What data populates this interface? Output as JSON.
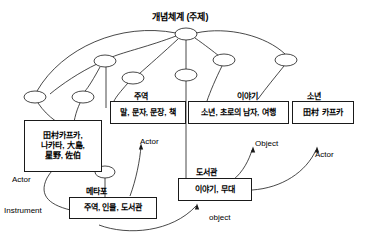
{
  "diagram": {
    "title": "개념체계 (주제)",
    "root_node": "root",
    "boxes": [
      {
        "id": "box-characters",
        "caption": "",
        "lines": [
          "田村카프카,",
          "나카타, 大島,",
          "星野, 佐伯"
        ],
        "x": 24,
        "y": 120,
        "w": 78,
        "h": 52,
        "font": 8
      },
      {
        "id": "box-language",
        "caption": "주역",
        "lines": [
          "말, 문자, 문장, 책"
        ],
        "x": 110,
        "y": 101,
        "w": 76,
        "h": 23,
        "font": 8
      },
      {
        "id": "box-story-elements",
        "caption": "이야기",
        "lines": [
          "소년, 초로의 남자, 여행"
        ],
        "x": 188,
        "y": 101,
        "w": 101,
        "h": 23,
        "font": 8
      },
      {
        "id": "box-kafka",
        "caption": "소년",
        "lines": [
          "田村 카프카"
        ],
        "x": 292,
        "y": 101,
        "w": 62,
        "h": 23,
        "font": 8
      },
      {
        "id": "box-metaphor",
        "caption": "메타포",
        "lines": [
          "주역, 인물, 도서관"
        ],
        "x": 69,
        "y": 197,
        "w": 88,
        "h": 22,
        "font": 8
      },
      {
        "id": "box-library",
        "caption": "도서관",
        "lines": [
          "이야기, 무대"
        ],
        "x": 178,
        "y": 178,
        "w": 74,
        "h": 23,
        "font": 8
      }
    ],
    "captions": [
      {
        "id": "caption-jueok",
        "text": "주역",
        "x": 134,
        "y": 90,
        "font": 8
      },
      {
        "id": "caption-iyagi",
        "text": "이야기",
        "x": 237,
        "y": 90,
        "font": 8
      },
      {
        "id": "caption-sonyeon",
        "text": "소년",
        "x": 307,
        "y": 90,
        "font": 8
      },
      {
        "id": "caption-metaphor",
        "text": "메타포",
        "x": 86,
        "y": 185,
        "font": 8
      },
      {
        "id": "caption-doseogwan",
        "text": "도서관",
        "x": 196,
        "y": 166,
        "font": 8
      }
    ],
    "relations": [
      {
        "id": "relation-actor-left",
        "text": "Actor",
        "x": 12,
        "y": 175,
        "font": 8
      },
      {
        "id": "relation-instrument",
        "text": "Instrument",
        "x": 4,
        "y": 206,
        "font": 8
      },
      {
        "id": "relation-actor-middle",
        "text": "Actor",
        "x": 140,
        "y": 137,
        "font": 8
      },
      {
        "id": "relation-object-upper",
        "text": "Object",
        "x": 255,
        "y": 139,
        "font": 8
      },
      {
        "id": "relation-actor-right",
        "text": "Actor",
        "x": 315,
        "y": 150,
        "font": 8
      },
      {
        "id": "relation-object-lower",
        "text": "object",
        "x": 209,
        "y": 213,
        "font": 8
      }
    ],
    "nodes": [
      {
        "id": "root",
        "cx": 186,
        "cy": 34,
        "rx": 11,
        "ry": 6
      },
      {
        "id": "n-left-hub",
        "cx": 105,
        "cy": 61,
        "rx": 11,
        "ry": 6
      },
      {
        "id": "n-far-left",
        "cx": 35,
        "cy": 97,
        "rx": 11,
        "ry": 6
      },
      {
        "id": "n-left-low",
        "cx": 83,
        "cy": 97,
        "rx": 11,
        "ry": 6
      },
      {
        "id": "n-mid-left",
        "cx": 133,
        "cy": 78,
        "rx": 11,
        "ry": 6
      },
      {
        "id": "n-center",
        "cx": 186,
        "cy": 75,
        "rx": 11,
        "ry": 6
      },
      {
        "id": "n-right",
        "cx": 224,
        "cy": 60,
        "rx": 11,
        "ry": 6
      },
      {
        "id": "n-far-right",
        "cx": 286,
        "cy": 60,
        "rx": 11,
        "ry": 6
      },
      {
        "id": "n-metaphor",
        "cx": 105,
        "cy": 172,
        "rx": 10,
        "ry": 6
      }
    ],
    "edges": [
      {
        "id": "edge-root-lefthub",
        "d": "M 176,36 C 150,46 124,52 112,57"
      },
      {
        "id": "edge-root-farleft",
        "d": "M 176,33 C 120,22 62,48 37,91"
      },
      {
        "id": "edge-root-midleft",
        "d": "M 178,39 C 164,52 148,66 139,74"
      },
      {
        "id": "edge-root-center",
        "d": "M 186,40 L 186,69"
      },
      {
        "id": "edge-root-right",
        "d": "M 195,38 C 205,45 214,52 219,56"
      },
      {
        "id": "edge-root-farright",
        "d": "M 196,33 C 228,26 266,36 285,54"
      },
      {
        "id": "edge-leftdown-1",
        "d": "M 100,67 C 94,78 88,88 85,91"
      },
      {
        "id": "edge-leftdown-2",
        "d": "M 106,67 L 106,108"
      },
      {
        "id": "edge-leftdown-3",
        "d": "M 97,64 C 80,72 62,84 50,94"
      },
      {
        "id": "edge-farleft-box",
        "d": "M 38,103 C 48,118 62,126 74,131"
      },
      {
        "id": "edge-leftlow-box",
        "d": "M 80,103 C 72,120 68,148 82,164"
      },
      {
        "id": "edge-midleft-lang",
        "d": "M 128,83 C 120,92 116,97 114,101"
      },
      {
        "id": "edge-center-story",
        "d": "M 186,81 L 186,178"
      },
      {
        "id": "edge-right-story",
        "d": "M 222,66 C 216,78 210,92 207,101"
      },
      {
        "id": "edge-farright-kafka",
        "d": "M 284,66 C 276,76 266,88 258,99"
      },
      {
        "id": "edge-metaphor-down",
        "d": "M 105,178 L 105,197"
      },
      {
        "id": "edge-actor-left-arrow",
        "d": "M 75,211 C 50,206 38,196 47,178 C 54,166 60,165 61,164"
      },
      {
        "id": "edge-actor-mid-arrow",
        "d": "M 130,196 C 136,180 140,160 141,146"
      },
      {
        "id": "edge-object-up-arrow",
        "d": "M 233,180 C 243,172 249,160 252,150"
      },
      {
        "id": "edge-actor-right-arrow",
        "d": "M 252,190 C 282,188 306,172 316,150"
      },
      {
        "id": "edge-object-low-arrow",
        "d": "M 99,225 C 128,236 172,232 196,206"
      }
    ],
    "arrowheads": [
      {
        "id": "arrow-actor-left",
        "x": 61,
        "y": 163
      },
      {
        "id": "arrow-actor-mid",
        "x": 141,
        "y": 145
      },
      {
        "id": "arrow-object-up",
        "x": 253,
        "y": 148
      },
      {
        "id": "arrow-actor-right",
        "x": 317,
        "y": 148
      },
      {
        "id": "arrow-object-low",
        "x": 197,
        "y": 205
      }
    ]
  }
}
